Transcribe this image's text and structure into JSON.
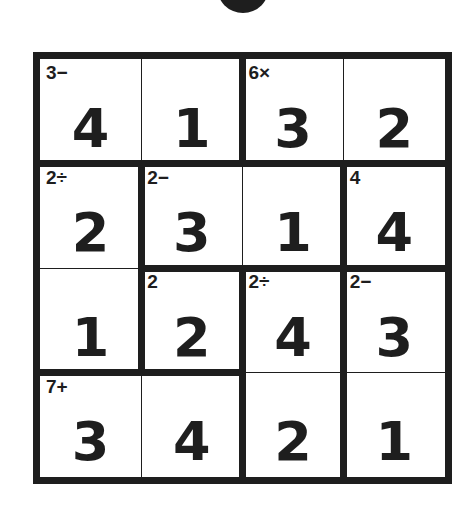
{
  "puzzle": {
    "type": "KenKen",
    "size": 4,
    "grid": [
      [
        4,
        1,
        3,
        2
      ],
      [
        2,
        3,
        1,
        4
      ],
      [
        1,
        2,
        4,
        3
      ],
      [
        3,
        4,
        2,
        1
      ]
    ],
    "cells": [
      {
        "r": 0,
        "c": 0,
        "value": "4",
        "clue": "3−"
      },
      {
        "r": 0,
        "c": 1,
        "value": "1",
        "clue": ""
      },
      {
        "r": 0,
        "c": 2,
        "value": "3",
        "clue": "6×"
      },
      {
        "r": 0,
        "c": 3,
        "value": "2",
        "clue": ""
      },
      {
        "r": 1,
        "c": 0,
        "value": "2",
        "clue": "2÷"
      },
      {
        "r": 1,
        "c": 1,
        "value": "3",
        "clue": "2−"
      },
      {
        "r": 1,
        "c": 2,
        "value": "1",
        "clue": ""
      },
      {
        "r": 1,
        "c": 3,
        "value": "4",
        "clue": "4"
      },
      {
        "r": 2,
        "c": 0,
        "value": "1",
        "clue": ""
      },
      {
        "r": 2,
        "c": 1,
        "value": "2",
        "clue": "2"
      },
      {
        "r": 2,
        "c": 2,
        "value": "4",
        "clue": "2÷"
      },
      {
        "r": 2,
        "c": 3,
        "value": "3",
        "clue": "2−"
      },
      {
        "r": 3,
        "c": 0,
        "value": "3",
        "clue": "7+"
      },
      {
        "r": 3,
        "c": 1,
        "value": "4",
        "clue": ""
      },
      {
        "r": 3,
        "c": 2,
        "value": "2",
        "clue": ""
      },
      {
        "r": 3,
        "c": 3,
        "value": "1",
        "clue": ""
      }
    ],
    "cages": [
      {
        "clue": "3−",
        "cells": [
          [
            0,
            0
          ],
          [
            0,
            1
          ]
        ]
      },
      {
        "clue": "6×",
        "cells": [
          [
            0,
            2
          ],
          [
            0,
            3
          ]
        ]
      },
      {
        "clue": "2÷",
        "cells": [
          [
            1,
            0
          ],
          [
            2,
            0
          ]
        ]
      },
      {
        "clue": "2−",
        "cells": [
          [
            1,
            1
          ],
          [
            1,
            2
          ]
        ]
      },
      {
        "clue": "4",
        "cells": [
          [
            1,
            3
          ]
        ]
      },
      {
        "clue": "2",
        "cells": [
          [
            2,
            1
          ]
        ]
      },
      {
        "clue": "2÷",
        "cells": [
          [
            2,
            2
          ],
          [
            3,
            2
          ]
        ]
      },
      {
        "clue": "2−",
        "cells": [
          [
            2,
            3
          ],
          [
            3,
            3
          ]
        ]
      },
      {
        "clue": "7+",
        "cells": [
          [
            3,
            0
          ],
          [
            3,
            1
          ]
        ]
      }
    ]
  },
  "colors": {
    "ink": "#1e1e1e",
    "background": "#ffffff"
  }
}
